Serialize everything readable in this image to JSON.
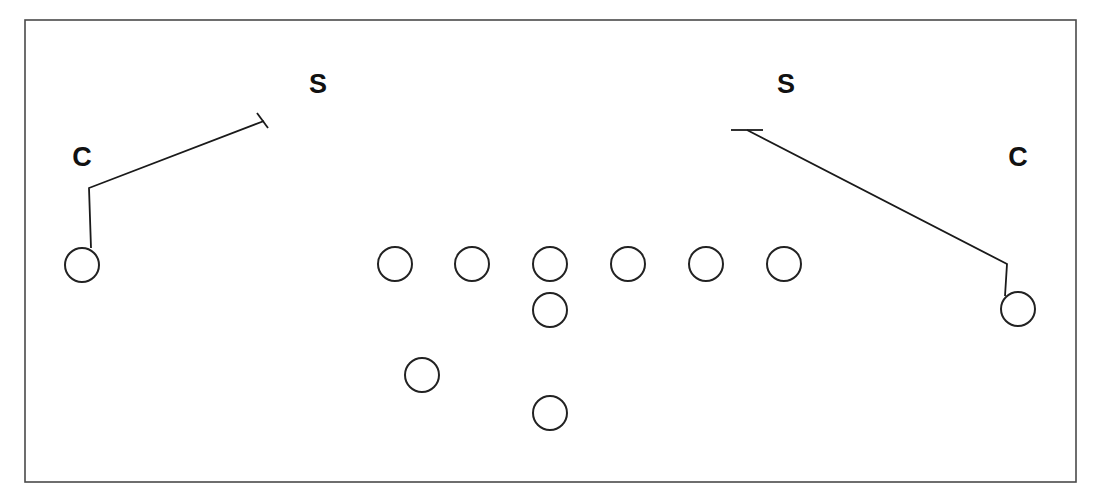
{
  "diagram": {
    "type": "football-play-diagram",
    "canvas": {
      "width": 1098,
      "height": 499
    },
    "frame": {
      "x": 25,
      "y": 20,
      "width": 1051,
      "height": 462,
      "stroke": "#4a4a4a"
    },
    "defenders": [
      {
        "id": "safety-left",
        "label": "S",
        "x": 318,
        "y": 86
      },
      {
        "id": "safety-right",
        "label": "S",
        "x": 786,
        "y": 86
      },
      {
        "id": "corner-left",
        "label": "C",
        "x": 82,
        "y": 159
      },
      {
        "id": "corner-right",
        "label": "C",
        "x": 1018,
        "y": 159
      }
    ],
    "offense": {
      "radius": 17,
      "players": [
        {
          "id": "wr-left",
          "x": 82,
          "y": 265
        },
        {
          "id": "ol-1",
          "x": 395,
          "y": 264
        },
        {
          "id": "ol-2",
          "x": 472,
          "y": 264
        },
        {
          "id": "center",
          "x": 550,
          "y": 264
        },
        {
          "id": "ol-4",
          "x": 628,
          "y": 264
        },
        {
          "id": "ol-5",
          "x": 706,
          "y": 264
        },
        {
          "id": "te",
          "x": 784,
          "y": 264
        },
        {
          "id": "qb",
          "x": 550,
          "y": 310
        },
        {
          "id": "fb",
          "x": 422,
          "y": 375
        },
        {
          "id": "rb",
          "x": 550,
          "y": 413
        },
        {
          "id": "wr-right",
          "x": 1018,
          "y": 309
        }
      ]
    },
    "routes": [
      {
        "id": "route-left-receiver",
        "points": "91,248 89,188 264,121",
        "end_marker": {
          "type": "T-bar",
          "x1": 257,
          "y1": 113,
          "x2": 268,
          "y2": 128
        }
      },
      {
        "id": "route-right-receiver",
        "points": "1005,296 1007,264 747,130",
        "end_marker": {
          "type": "T-bar",
          "x1": 731,
          "y1": 130,
          "x2": 763,
          "y2": 130
        }
      }
    ]
  }
}
